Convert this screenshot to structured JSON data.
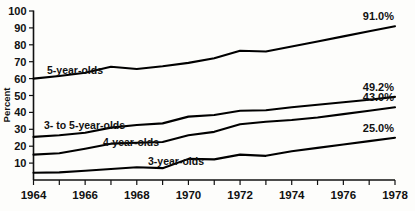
{
  "chart_data": {
    "type": "line",
    "title": "",
    "xlabel": "",
    "ylabel": "Percent",
    "xlim": [
      1964,
      1978
    ],
    "ylim": [
      0,
      100
    ],
    "grid": false,
    "legend_position": "inline-annotations",
    "x": [
      1964,
      1965,
      1966,
      1967,
      1968,
      1969,
      1970,
      1971,
      1972,
      1973,
      1974,
      1975,
      1976,
      1977,
      1978
    ],
    "x_tick_labels": [
      "1964",
      "1966",
      "1968",
      "1970",
      "1972",
      "1974",
      "1976",
      "1978"
    ],
    "x_tick_values": [
      1964,
      1966,
      1968,
      1970,
      1972,
      1974,
      1976,
      1978
    ],
    "y_tick_labels": [
      "10",
      "20",
      "30",
      "40",
      "50",
      "60",
      "70",
      "80",
      "90",
      "100"
    ],
    "y_tick_values": [
      10,
      20,
      30,
      40,
      50,
      60,
      70,
      80,
      90,
      100
    ],
    "series": [
      {
        "name": "5-year-olds",
        "label": "5-year-olds",
        "end_label": "91.0%",
        "end_value": 91.0,
        "values": [
          60.0,
          61.5,
          63.5,
          67.0,
          65.7,
          67.3,
          69.3,
          72.0,
          76.5,
          76.0,
          79.0,
          82.0,
          85.0,
          88.0,
          91.0
        ]
      },
      {
        "name": "3- to 5-year-olds",
        "label": "3- to 5-year-olds",
        "end_label": "49.2%",
        "end_value": 49.2,
        "values": [
          25.5,
          26.5,
          28.0,
          31.0,
          32.5,
          33.5,
          37.5,
          38.5,
          41.0,
          41.3,
          43.0,
          44.5,
          46.0,
          47.5,
          49.2
        ]
      },
      {
        "name": "4-year-olds",
        "label": "4-year-olds",
        "end_label": "43.0%",
        "end_value": 43.0,
        "values": [
          15.0,
          15.8,
          18.5,
          21.5,
          22.0,
          22.5,
          26.5,
          28.5,
          33.0,
          34.5,
          35.5,
          37.0,
          39.0,
          41.0,
          43.0
        ]
      },
      {
        "name": "3-year-olds",
        "label": "3-year-olds",
        "end_label": "25.0%",
        "end_value": 25.0,
        "values": [
          4.3,
          4.5,
          5.5,
          6.5,
          7.5,
          7.0,
          12.5,
          12.2,
          15.0,
          14.3,
          17.0,
          19.0,
          21.0,
          23.0,
          25.0
        ]
      }
    ],
    "annotations": [
      {
        "name": "label-5-year-olds",
        "text": "5-year-olds",
        "x_px": 47,
        "y_px": 74
      },
      {
        "name": "label-3-to-5-year-olds",
        "text": "3- to 5-year-olds",
        "x_px": 44,
        "y_px": 129
      },
      {
        "name": "label-4-year-olds",
        "text": "4-year-olds",
        "x_px": 103,
        "y_px": 146
      },
      {
        "name": "label-3-year-olds",
        "text": "3-year-olds",
        "x_px": 148,
        "y_px": 165
      }
    ],
    "colors": {
      "line": "#000000",
      "axis": "#111111",
      "background": "#fdfdfb",
      "text": "#111111"
    }
  }
}
